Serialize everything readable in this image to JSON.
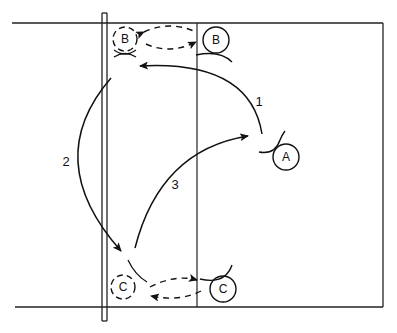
{
  "diagram": {
    "type": "volleyball-court-rotation-play",
    "colors": {
      "ink": "#111111",
      "background": "#ffffff"
    },
    "players": [
      {
        "id": "B-start",
        "label": "B",
        "style": "solid"
      },
      {
        "id": "B-end",
        "label": "B",
        "style": "dashed"
      },
      {
        "id": "A",
        "label": "A",
        "style": "solid"
      },
      {
        "id": "C-start",
        "label": "C",
        "style": "solid"
      },
      {
        "id": "C-end",
        "label": "C",
        "style": "dashed"
      }
    ],
    "paths": [
      {
        "label": "1",
        "description": "ball path from A to near B at net"
      },
      {
        "label": "2",
        "description": "ball path from B down to C"
      },
      {
        "label": "3",
        "description": "ball path from C back to A"
      }
    ]
  }
}
